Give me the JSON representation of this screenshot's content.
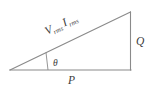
{
  "diagram": {
    "name": "power-triangle",
    "type": "right-triangle-vector-diagram",
    "background_color": "#ffffff",
    "line_color": "#8a8a8a",
    "text_color": "#3b3b3b",
    "labels": {
      "hypotenuse_v": "V",
      "hypotenuse_v_sub": "rms",
      "hypotenuse_i": "I",
      "hypotenuse_i_sub": "rms",
      "vertical_side": "Q",
      "base_side": "P",
      "angle": "θ"
    },
    "geometry": {
      "apex_left": "10,70",
      "corner_top_right": "130,12",
      "corner_bottom_right": "131,70",
      "hypotenuse_label_rotation_deg": -26,
      "angle_marker_from": "46,53",
      "angle_marker_to": "48,70"
    }
  }
}
